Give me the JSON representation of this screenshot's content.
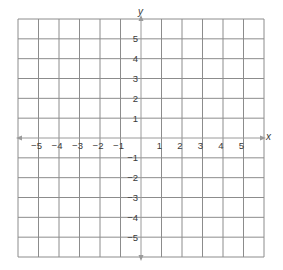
{
  "chart_data": {
    "type": "scatter",
    "title": "",
    "xlabel": "x",
    "ylabel": "y",
    "xlim": [
      -6,
      6
    ],
    "ylim": [
      -6,
      6
    ],
    "grid": true,
    "x_ticks": [
      -5,
      -4,
      -3,
      -2,
      -1,
      1,
      2,
      3,
      4,
      5
    ],
    "y_ticks": [
      5,
      4,
      3,
      2,
      1,
      -1,
      -2,
      -3,
      -4,
      -5
    ],
    "x_tick_labels": [
      "−5",
      "−4",
      "−3",
      "−2",
      "−1",
      "1",
      "2",
      "3",
      "4",
      "5"
    ],
    "y_tick_labels": [
      "5",
      "4",
      "3",
      "2",
      "1",
      "−1",
      "−2",
      "−3",
      "−4",
      "−5"
    ],
    "points": [],
    "legend": null
  },
  "axes": {
    "x_label": "x",
    "y_label": "y"
  },
  "colors": {
    "grid": "#8c8c8c",
    "axis": "#9a9a9a",
    "text": "#3a3a3a",
    "background": "#ffffff"
  }
}
